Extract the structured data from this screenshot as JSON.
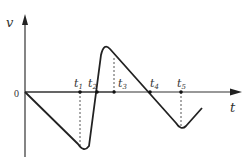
{
  "axes": {
    "y_label": "v",
    "x_label": "t",
    "origin_label": "0"
  },
  "time_marks": [
    {
      "label": "t",
      "sub": "1"
    },
    {
      "label": "t",
      "sub": "2"
    },
    {
      "label": "t",
      "sub": "3"
    },
    {
      "label": "t",
      "sub": "4"
    },
    {
      "label": "t",
      "sub": "5"
    }
  ],
  "colors": {
    "axis": "#333333",
    "curve": "#222222",
    "dashed": "#555555"
  }
}
